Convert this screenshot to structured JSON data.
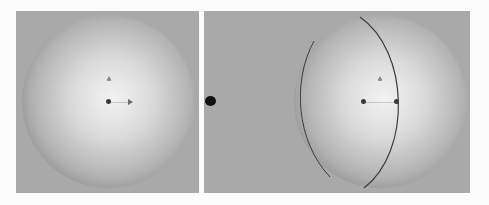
{
  "figure": {
    "panels": [
      {
        "id": "left",
        "label": "",
        "content": "shaded sphere, front view",
        "markers": [
          "origin-dot",
          "up-marker",
          "right-arrow"
        ]
      },
      {
        "id": "right",
        "label": "",
        "content": "shaded sphere with meridian outline",
        "markers": [
          "left-dot",
          "up-marker",
          "right-dot"
        ]
      }
    ],
    "colors": {
      "background": "#a9a9a9",
      "page": "#fbfbfb",
      "marker": "#3a3a3a",
      "meridian": "#3c3c3c",
      "separator_dot": "#111111"
    }
  }
}
